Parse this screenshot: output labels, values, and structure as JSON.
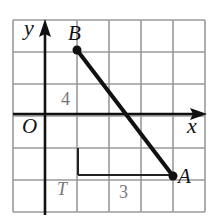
{
  "diagram": {
    "type": "coordinate-grid",
    "grid": {
      "columns": 6,
      "rows": 6,
      "cell_px": 32,
      "origin_px": [
        13,
        20
      ],
      "line_color": "#9a9a9a"
    },
    "axes": {
      "x_label": "x",
      "y_label": "y",
      "origin_label": "O",
      "color": "#111111"
    },
    "points": [
      {
        "name": "B",
        "label": "B",
        "grid": [
          1,
          3
        ]
      },
      {
        "name": "A",
        "label": "A",
        "grid": [
          4,
          -2
        ]
      }
    ],
    "segment": {
      "from": "B",
      "to": "A",
      "color": "#111111"
    },
    "helper_triangle": {
      "vertex_label": "T",
      "vertical_leg_label": "4",
      "horizontal_leg_label": "3"
    }
  }
}
